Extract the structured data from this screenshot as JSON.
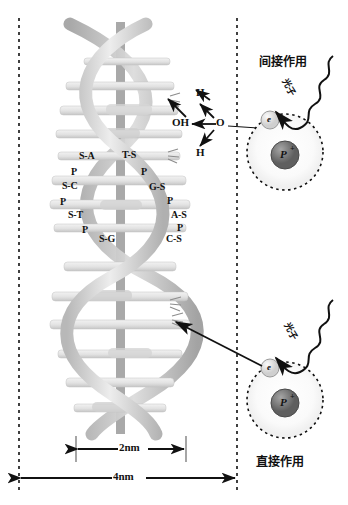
{
  "figure": {
    "title_visible": false,
    "width": 348,
    "height": 505,
    "background": "#ffffff"
  },
  "panels": {
    "left": {
      "name": "dna-panel"
    },
    "right": {
      "name": "radiation-panel"
    }
  },
  "annotations": {
    "indirect_action": "间接作用",
    "direct_action": "直接作用",
    "photon_upper": "光子",
    "photon_lower": "光子"
  },
  "radiolysis": {
    "center": "O",
    "hydroxyl": "OH",
    "hydrogen_top": "H",
    "hydrogen_bottom": "H"
  },
  "atoms": {
    "upper": {
      "electron": "e",
      "nucleus": "P",
      "charge": "+"
    },
    "lower": {
      "electron": "e",
      "nucleus": "P",
      "charge": "+"
    }
  },
  "dna": {
    "left_strand": [
      "S-A",
      "P",
      "S-C",
      "P",
      "S-T",
      "P",
      "S-G"
    ],
    "right_strand": [
      "T-S",
      "P",
      "G-S",
      "P",
      "A-S",
      "P",
      "C-S"
    ],
    "pairs": [
      {
        "left": "S-A",
        "right": "T-S"
      },
      {
        "left": "S-C",
        "right": "G-S"
      },
      {
        "left": "S-T",
        "right": "A-S"
      },
      {
        "left": "S-G",
        "right": "C-S"
      }
    ],
    "phosphate_label": "P"
  },
  "scalebars": {
    "inner": "2nm",
    "outer": "4nm"
  },
  "colors": {
    "ink": "#111111",
    "helix_light": "#e9e9e9",
    "helix_mid": "#c9c9c9",
    "helix_dark": "#a8a8a8",
    "axis": "#9a9a9a",
    "nucleus": "#6e6e6e",
    "electron": "#dcdcdc"
  }
}
